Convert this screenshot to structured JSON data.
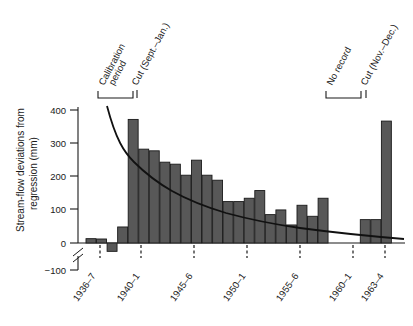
{
  "chart_data": {
    "type": "bar",
    "title": "",
    "xlabel": "",
    "ylabel": "Stream-flow deviations from regression (mm)",
    "ylabel_line1": "Stream-flow deviations from",
    "ylabel_line2": "regression (mm)",
    "ylim": [
      -100,
      400
    ],
    "ytick_labels": [
      "400",
      "300",
      "200",
      "100",
      "0",
      "−100"
    ],
    "ytick_values": [
      400,
      300,
      200,
      100,
      0,
      -100
    ],
    "axis_break": true,
    "grid": false,
    "legend": "none",
    "bar_color": "#585858",
    "bar_edge_color": "#1a1a1a",
    "curve_color": "#111111",
    "categories": [
      "1935–6",
      "1936–7",
      "1937–8",
      "1938–9",
      "1939–40",
      "1940–1",
      "1941–2",
      "1942–3",
      "1943–4",
      "1944–5",
      "1945–6",
      "1946–7",
      "1947–8",
      "1948–9",
      "1949–50",
      "1950–1",
      "1951–2",
      "1952–3",
      "1953–4",
      "1954–5",
      "1955–6",
      "1956–7",
      "1957–8",
      "1958–9",
      "1961–2",
      "1962–3",
      "1963–4"
    ],
    "values": [
      13,
      12,
      -25,
      48,
      370,
      281,
      276,
      242,
      236,
      203,
      248,
      203,
      188,
      124,
      124,
      134,
      157,
      85,
      99,
      54,
      113,
      80,
      134,
      0,
      70,
      70,
      365
    ],
    "xtick_labels": [
      "1936–7",
      "1940–1",
      "1945–6",
      "1950–1",
      "1955–6",
      "1960–1",
      "1963–4"
    ],
    "no_record_gap": true,
    "fitted_curve_label": "exponential decay fit",
    "annotations": [
      {
        "id": "calibration-period",
        "text": "Calibration period",
        "line1": "Calibration",
        "line2": "period",
        "bracket": true
      },
      {
        "id": "cut-sept-jan",
        "text": "Cut (Sept.–Jan.)",
        "bracket": false
      },
      {
        "id": "no-record",
        "text": "No record",
        "bracket": true
      },
      {
        "id": "cut-nov-dec",
        "text": "Cut (Nov.–Dec.)",
        "bracket": false
      }
    ]
  }
}
